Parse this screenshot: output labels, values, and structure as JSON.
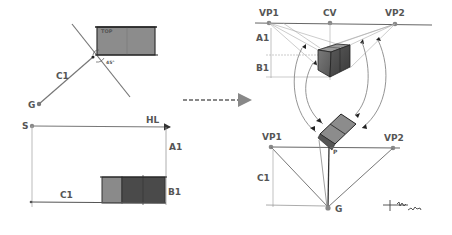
{
  "left_top": {
    "top_label": "TOP",
    "angle_label": "45°",
    "c1_label": "C1",
    "g_label": "G"
  },
  "left_bottom": {
    "s_label": "S",
    "hl_label": "HL",
    "a1_label": "A1",
    "b1_label": "B1",
    "c1_label": "C1"
  },
  "right_top": {
    "vp1_label": "VP1",
    "cv_label": "CV",
    "vp2_label": "VP2",
    "a1_label": "A1",
    "b1_label": "B1"
  },
  "right_bottom": {
    "vp1_label": "VP1",
    "vp2_label": "VP2",
    "c1_label": "C1",
    "g_label": "G",
    "p_label": "P"
  },
  "signature": "sketch signature",
  "colors": {
    "line": "#777777",
    "dark_line": "#333333",
    "fill_light": "#8c8c8c",
    "fill_dark": "#4a4a4a",
    "label": "#555555",
    "arrow": "#888888"
  }
}
